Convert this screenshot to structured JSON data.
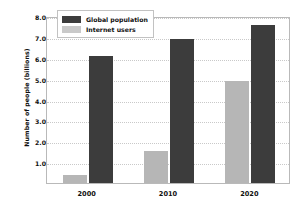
{
  "chart_data": {
    "type": "bar",
    "title": "",
    "xlabel": "",
    "ylabel": "Number of people (billions)",
    "categories": [
      "2000",
      "2010",
      "2020"
    ],
    "series": [
      {
        "name": "Global population",
        "color": "#3c3c3c",
        "values": [
          6.1,
          6.9,
          7.55
        ]
      },
      {
        "name": "Internet users",
        "color": "#b6b6b6",
        "values": [
          0.4,
          1.55,
          4.9
        ]
      }
    ],
    "series_order_in_plot": [
      "Internet users",
      "Global population"
    ],
    "ylim": [
      0,
      8.0
    ],
    "yticks": [
      "1.0",
      "2.0",
      "3.0",
      "4.0",
      "5.0",
      "6.0",
      "7.0",
      "8.0"
    ],
    "ytick_values": [
      1.0,
      2.0,
      3.0,
      4.0,
      5.0,
      6.0,
      7.0,
      8.0
    ],
    "grid": true,
    "grid_style": "dotted-horizontal",
    "legend_position": "upper-left-inside",
    "plot_background": "#ffffff",
    "figure_background": "#ffffff",
    "axis_border_color": "#b9b9b9",
    "gridline_color": "#c9c9c9"
  }
}
